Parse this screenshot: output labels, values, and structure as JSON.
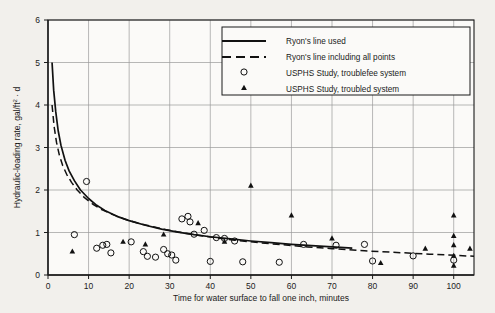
{
  "chart_data": {
    "type": "scatter",
    "title": "",
    "xlabel": "Time for water surface to fall one inch, minutes",
    "ylabel": "Hydraulic-loading rate, gal/ft",
    "ylabel_sup": "2",
    "ylabel_tail": " · d",
    "xlim": [
      0,
      105
    ],
    "ylim": [
      0,
      6
    ],
    "xticks": [
      0,
      10,
      20,
      30,
      40,
      50,
      60,
      70,
      80,
      90,
      100
    ],
    "yticks": [
      0,
      1,
      2,
      3,
      4,
      5,
      6
    ],
    "grid": true,
    "legend_position": "top-right",
    "series": [
      {
        "name": "Ryon's line used",
        "type": "line",
        "style": "solid",
        "points": [
          [
            1.0,
            5.0
          ],
          [
            1.4,
            4.35
          ],
          [
            1.9,
            3.85
          ],
          [
            2.5,
            3.4
          ],
          [
            3.2,
            3.05
          ],
          [
            4.2,
            2.7
          ],
          [
            5.2,
            2.45
          ],
          [
            6.5,
            2.22
          ],
          [
            8.0,
            2.0
          ],
          [
            10.0,
            1.8
          ],
          [
            12.0,
            1.64
          ],
          [
            14.0,
            1.52
          ],
          [
            17.0,
            1.38
          ],
          [
            20.0,
            1.28
          ],
          [
            24.0,
            1.17
          ],
          [
            28.0,
            1.08
          ],
          [
            32.0,
            1.01
          ],
          [
            36.0,
            0.95
          ],
          [
            40.0,
            0.9
          ],
          [
            45.0,
            0.85
          ],
          [
            50.0,
            0.8
          ],
          [
            55.0,
            0.76
          ],
          [
            60.0,
            0.72
          ],
          [
            65.0,
            0.69
          ],
          [
            70.0,
            0.66
          ],
          [
            75.0,
            0.63
          ]
        ]
      },
      {
        "name": "Ryon's line including all points",
        "type": "line",
        "style": "dashed",
        "points": [
          [
            1.0,
            4.0
          ],
          [
            1.5,
            3.5
          ],
          [
            2.1,
            3.12
          ],
          [
            2.8,
            2.82
          ],
          [
            3.6,
            2.58
          ],
          [
            4.6,
            2.37
          ],
          [
            5.8,
            2.18
          ],
          [
            7.2,
            2.0
          ],
          [
            9.0,
            1.82
          ],
          [
            11.0,
            1.67
          ],
          [
            13.0,
            1.55
          ],
          [
            16.0,
            1.42
          ],
          [
            19.0,
            1.31
          ],
          [
            23.0,
            1.2
          ],
          [
            27.0,
            1.11
          ],
          [
            31.0,
            1.03
          ],
          [
            36.0,
            0.95
          ],
          [
            41.0,
            0.88
          ],
          [
            46.0,
            0.82
          ],
          [
            52.0,
            0.76
          ],
          [
            58.0,
            0.71
          ],
          [
            64.0,
            0.66
          ],
          [
            70.0,
            0.62
          ],
          [
            78.0,
            0.57
          ],
          [
            86.0,
            0.53
          ],
          [
            94.0,
            0.49
          ],
          [
            101.0,
            0.46
          ],
          [
            105.0,
            0.44
          ]
        ]
      },
      {
        "name": "USPHS Study, troublefee system",
        "type": "scatter",
        "marker": "open-circle",
        "points": [
          [
            9.5,
            2.2
          ],
          [
            6.5,
            0.95
          ],
          [
            12.0,
            0.63
          ],
          [
            13.5,
            0.7
          ],
          [
            14.5,
            0.72
          ],
          [
            15.5,
            0.52
          ],
          [
            20.5,
            0.78
          ],
          [
            23.5,
            0.55
          ],
          [
            24.5,
            0.44
          ],
          [
            26.5,
            0.42
          ],
          [
            28.5,
            0.6
          ],
          [
            29.5,
            0.5
          ],
          [
            30.5,
            0.47
          ],
          [
            31.5,
            0.35
          ],
          [
            33.0,
            1.32
          ],
          [
            34.5,
            1.38
          ],
          [
            35.0,
            1.25
          ],
          [
            36.0,
            0.96
          ],
          [
            38.5,
            1.05
          ],
          [
            40.0,
            0.32
          ],
          [
            41.5,
            0.88
          ],
          [
            43.5,
            0.86
          ],
          [
            46.0,
            0.8
          ],
          [
            48.0,
            0.31
          ],
          [
            57.0,
            0.3
          ],
          [
            63.0,
            0.72
          ],
          [
            71.0,
            0.7
          ],
          [
            78.0,
            0.72
          ],
          [
            80.0,
            0.33
          ],
          [
            90.0,
            0.45
          ],
          [
            100.0,
            0.35
          ]
        ]
      },
      {
        "name": "USPHS Study, troubled system",
        "type": "scatter",
        "marker": "filled-triangle",
        "points": [
          [
            6.0,
            0.55
          ],
          [
            18.5,
            0.78
          ],
          [
            24.0,
            0.72
          ],
          [
            28.5,
            0.95
          ],
          [
            37.0,
            1.22
          ],
          [
            43.5,
            0.78
          ],
          [
            50.0,
            2.1
          ],
          [
            60.0,
            1.4
          ],
          [
            70.0,
            0.86
          ],
          [
            82.0,
            0.28
          ],
          [
            93.0,
            0.62
          ],
          [
            100.0,
            1.4
          ],
          [
            100.0,
            0.92
          ],
          [
            100.0,
            0.7
          ],
          [
            100.0,
            0.45
          ],
          [
            100.0,
            0.22
          ],
          [
            104.0,
            0.62
          ]
        ]
      }
    ]
  },
  "legend": {
    "items": [
      {
        "label": "Ryon's line used",
        "marker": "solid-line"
      },
      {
        "label": "Ryon's line including all points",
        "marker": "dashed-line"
      },
      {
        "label": "USPHS Study, troublefee system",
        "marker": "open-circle"
      },
      {
        "label": "USPHS Study, troubled system",
        "marker": "filled-triangle"
      }
    ]
  },
  "colors": {
    "background": "#f2f0ec",
    "plot_background": "#fbfaf8",
    "axis": "#1a1a1a",
    "grid": "#9a9a9a",
    "data": "#111111"
  }
}
